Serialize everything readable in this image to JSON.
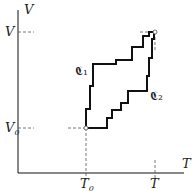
{
  "diagram": {
    "type": "step-paths in T-V plane",
    "axes": {
      "x_label": "T",
      "y_label": "V"
    },
    "ticks": {
      "x": [
        {
          "label": "T",
          "sub": "0"
        },
        {
          "label": "T",
          "sub": ""
        }
      ],
      "y": [
        {
          "label": "V",
          "sub": "0"
        },
        {
          "label": "V",
          "sub": ""
        }
      ]
    },
    "paths": [
      {
        "name": "C",
        "sub": "1",
        "label": "𝕮₁"
      },
      {
        "name": "C",
        "sub": "2",
        "label": "𝕮₂"
      }
    ],
    "points": [
      {
        "name": "start",
        "coords": "(T0, V0)"
      },
      {
        "name": "end",
        "coords": "(T, V)"
      }
    ],
    "colors": {
      "line": "#111111",
      "dash": "#555555"
    }
  }
}
